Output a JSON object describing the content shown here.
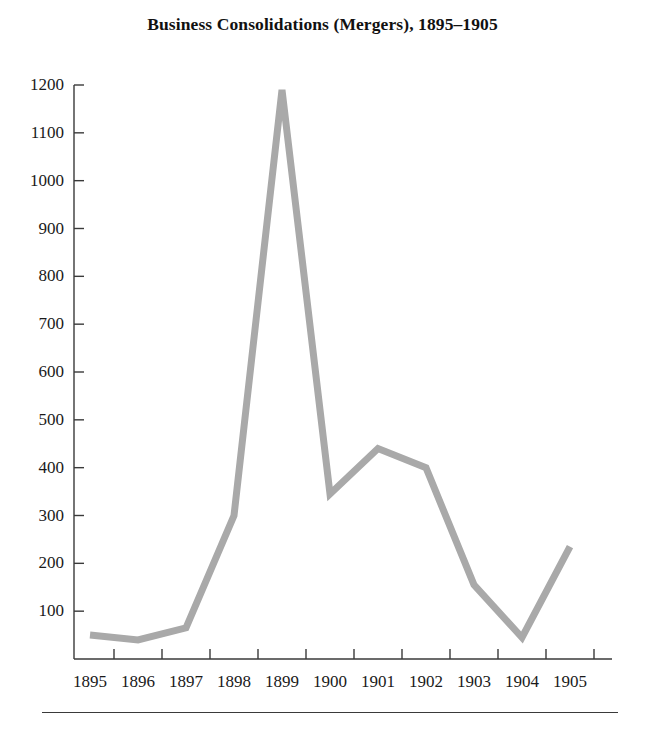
{
  "chart_data": {
    "type": "line",
    "title": "Business Consolidations (Mergers), 1895–1905",
    "xlabel": "",
    "ylabel": "",
    "categories": [
      "1895",
      "1896",
      "1897",
      "1898",
      "1899",
      "1900",
      "1901",
      "1902",
      "1903",
      "1904",
      "1905"
    ],
    "values": [
      50,
      40,
      65,
      300,
      1190,
      345,
      440,
      400,
      155,
      45,
      235
    ],
    "series": [
      {
        "name": "Business consolidations (mergers)",
        "values": [
          50,
          40,
          65,
          300,
          1190,
          345,
          440,
          400,
          155,
          45,
          235
        ]
      }
    ],
    "ylim": [
      0,
      1240
    ],
    "yticks": [
      100,
      200,
      300,
      400,
      500,
      600,
      700,
      800,
      900,
      1000,
      1100,
      1200
    ],
    "ytick_labels": [
      "100",
      "200",
      "300",
      "400",
      "500",
      "600",
      "700",
      "800",
      "900",
      "1000",
      "1100",
      "1200"
    ],
    "xtick_labels": [
      "1895",
      "1896",
      "1897",
      "1898",
      "1899",
      "1900",
      "1901",
      "1902",
      "1903",
      "1904",
      "1905"
    ],
    "grid": false,
    "legend": false,
    "line_color": "#a9a9a9",
    "axis_color": "#3a3a3a",
    "text_color": "#1a1a1a",
    "background": "#ffffff"
  },
  "figure": {
    "title": "Business Consolidations (Mergers), 1895–1905",
    "footer_rule": true
  }
}
